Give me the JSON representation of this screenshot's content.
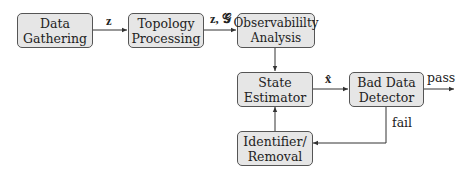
{
  "diagram": {
    "nodes": [
      {
        "id": "data-gathering",
        "lines": [
          "Data",
          "Gathering"
        ]
      },
      {
        "id": "topology-processing",
        "lines": [
          "Topology",
          "Processing"
        ]
      },
      {
        "id": "observability-analysis",
        "lines": [
          "Observabililty",
          "Analysis"
        ]
      },
      {
        "id": "state-estimator",
        "lines": [
          "State",
          "Estimator"
        ]
      },
      {
        "id": "bad-data-detector",
        "lines": [
          "Bad Data",
          "Detector"
        ]
      },
      {
        "id": "identifier-removal",
        "lines": [
          "Identifier/",
          "Removal"
        ]
      }
    ],
    "edges": [
      {
        "from": "data-gathering",
        "to": "topology-processing",
        "label": "z"
      },
      {
        "from": "topology-processing",
        "to": "observability-analysis",
        "label": "z, 𝒢"
      },
      {
        "from": "observability-analysis",
        "to": "state-estimator",
        "label": ""
      },
      {
        "from": "state-estimator",
        "to": "bad-data-detector",
        "label": "x̂"
      },
      {
        "from": "bad-data-detector",
        "to": "output",
        "label": "pass"
      },
      {
        "from": "bad-data-detector",
        "to": "identifier-removal",
        "label": "fail"
      },
      {
        "from": "identifier-removal",
        "to": "state-estimator",
        "label": ""
      }
    ],
    "colors": {
      "box_fill": "#e6e6e6",
      "box_border": "#555555",
      "line": "#333333"
    }
  }
}
